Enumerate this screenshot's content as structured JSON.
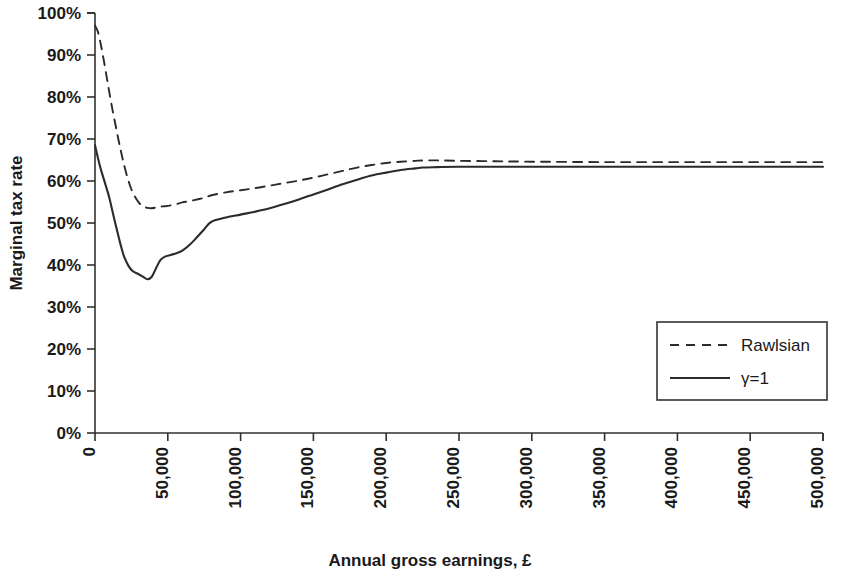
{
  "chart_data": {
    "type": "line",
    "title": "",
    "xlabel": "Annual gross earnings, £",
    "ylabel": "Marginal tax rate",
    "xlim": [
      0,
      500000
    ],
    "ylim": [
      0,
      1.0
    ],
    "grid": false,
    "legend_position": "bottom-right",
    "xticks": [
      0,
      50000,
      100000,
      150000,
      200000,
      250000,
      300000,
      350000,
      400000,
      450000,
      500000
    ],
    "xtick_labels": [
      "0",
      "50,000",
      "100,000",
      "150,000",
      "200,000",
      "250,000",
      "300,000",
      "350,000",
      "400,000",
      "450,000",
      "500,000"
    ],
    "yticks": [
      0,
      0.1,
      0.2,
      0.3,
      0.4,
      0.5,
      0.6,
      0.7,
      0.8,
      0.9,
      1.0
    ],
    "ytick_labels": [
      "0%",
      "10%",
      "20%",
      "30%",
      "40%",
      "50%",
      "60%",
      "70%",
      "80%",
      "90%",
      "100%"
    ],
    "x": [
      0,
      2000,
      4000,
      6000,
      8000,
      10000,
      12000,
      14000,
      16000,
      18000,
      20000,
      23000,
      26000,
      30000,
      33000,
      36000,
      39000,
      42000,
      45000,
      48000,
      52000,
      56000,
      60000,
      65000,
      70000,
      75000,
      80000,
      90000,
      100000,
      110000,
      120000,
      130000,
      140000,
      150000,
      160000,
      170000,
      180000,
      190000,
      200000,
      210000,
      220000,
      225000,
      235000,
      250000,
      275000,
      300000,
      350000,
      400000,
      450000,
      500000
    ],
    "series": [
      {
        "name": "Rawlsian",
        "style": "dashed",
        "values": [
          0.97,
          0.955,
          0.925,
          0.888,
          0.848,
          0.808,
          0.77,
          0.735,
          0.7,
          0.668,
          0.638,
          0.6,
          0.572,
          0.549,
          0.54,
          0.536,
          0.535,
          0.537,
          0.539,
          0.54,
          0.542,
          0.545,
          0.549,
          0.552,
          0.556,
          0.56,
          0.566,
          0.573,
          0.578,
          0.583,
          0.589,
          0.595,
          0.601,
          0.608,
          0.616,
          0.624,
          0.632,
          0.638,
          0.643,
          0.646,
          0.648,
          0.649,
          0.649,
          0.648,
          0.647,
          0.646,
          0.645,
          0.645,
          0.645,
          0.645
        ]
      },
      {
        "name": "γ=1",
        "style": "solid",
        "values": [
          0.685,
          0.655,
          0.628,
          0.605,
          0.582,
          0.558,
          0.528,
          0.498,
          0.47,
          0.443,
          0.42,
          0.398,
          0.385,
          0.378,
          0.372,
          0.366,
          0.372,
          0.393,
          0.412,
          0.42,
          0.424,
          0.428,
          0.434,
          0.448,
          0.466,
          0.485,
          0.503,
          0.513,
          0.52,
          0.527,
          0.535,
          0.545,
          0.556,
          0.568,
          0.58,
          0.592,
          0.603,
          0.613,
          0.62,
          0.626,
          0.63,
          0.632,
          0.633,
          0.634,
          0.634,
          0.634,
          0.634,
          0.634,
          0.634,
          0.634
        ]
      }
    ]
  },
  "legend": {
    "items": [
      {
        "label": "Rawlsian",
        "style": "dashed"
      },
      {
        "label": "γ=1",
        "style": "solid"
      }
    ]
  }
}
